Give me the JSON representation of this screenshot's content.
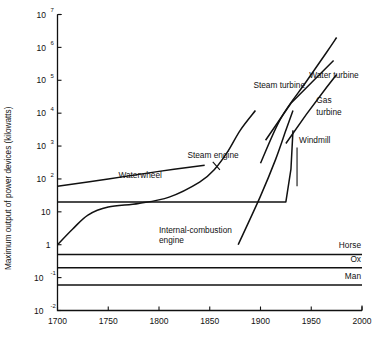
{
  "chart_data": {
    "type": "line",
    "title": "",
    "xlabel": "",
    "ylabel": "Maximum output of power devices (kilowatts)",
    "xlim": [
      1700,
      2000
    ],
    "ylim": [
      0.01,
      10000000
    ],
    "yscale": "log",
    "xscale": "linear",
    "grid": false,
    "legend": "inline-annotations",
    "xticks": [
      "1700",
      "1750",
      "1800",
      "1850",
      "1900",
      "1950",
      "2000"
    ],
    "xtick_values": [
      1700,
      1750,
      1800,
      1850,
      1900,
      1950,
      2000
    ],
    "yticks": [
      {
        "base": "10",
        "exp": "7",
        "value": 10000000
      },
      {
        "base": "10",
        "exp": "6",
        "value": 1000000
      },
      {
        "base": "10",
        "exp": "5",
        "value": 100000
      },
      {
        "base": "10",
        "exp": "4",
        "value": 10000
      },
      {
        "base": "10",
        "exp": "3",
        "value": 1000
      },
      {
        "base": "10",
        "exp": "2",
        "value": 100
      },
      {
        "base": "10",
        "exp": "",
        "value": 10
      },
      {
        "base": "1",
        "exp": "",
        "value": 1
      },
      {
        "base": "10",
        "exp": "-1",
        "value": 0.1
      },
      {
        "base": "10",
        "exp": "-2",
        "value": 0.01
      }
    ],
    "series": [
      {
        "name": "Waterwheel",
        "label": "Waterwheel",
        "points": [
          [
            1700,
            60
          ],
          [
            1750,
            100
          ],
          [
            1800,
            170
          ],
          [
            1845,
            260
          ]
        ]
      },
      {
        "name": "Windmill",
        "label": "Windmill",
        "points": [
          [
            1700,
            20
          ],
          [
            1800,
            20
          ],
          [
            1900,
            20
          ],
          [
            1925,
            20
          ],
          [
            1930,
            200
          ],
          [
            1932,
            3000
          ]
        ]
      },
      {
        "name": "Steam engine",
        "label": "Steam engine",
        "points": [
          [
            1700,
            1
          ],
          [
            1715,
            3
          ],
          [
            1730,
            8
          ],
          [
            1750,
            14
          ],
          [
            1780,
            18
          ],
          [
            1810,
            28
          ],
          [
            1840,
            80
          ],
          [
            1855,
            200
          ],
          [
            1868,
            700
          ],
          [
            1880,
            3000
          ],
          [
            1895,
            12000
          ]
        ]
      },
      {
        "name": "Internal-combustion engine",
        "label": "Internal-combustion engine",
        "points": [
          [
            1878,
            1
          ],
          [
            1900,
            30
          ],
          [
            1915,
            400
          ],
          [
            1925,
            3000
          ],
          [
            1932,
            12000
          ]
        ]
      },
      {
        "name": "Steam turbine",
        "label": "Steam turbine",
        "points": [
          [
            1900,
            300
          ],
          [
            1920,
            7000
          ],
          [
            1945,
            90000
          ],
          [
            1965,
            700000
          ],
          [
            1975,
            2000000
          ]
        ]
      },
      {
        "name": "Water turbine",
        "label": "Water turbine",
        "points": [
          [
            1905,
            1500
          ],
          [
            1930,
            20000
          ],
          [
            1955,
            120000
          ],
          [
            1972,
            400000
          ]
        ]
      },
      {
        "name": "Gas turbine",
        "label": "Gas turbine",
        "points": [
          [
            1925,
            1200
          ],
          [
            1945,
            9000
          ],
          [
            1965,
            60000
          ],
          [
            1975,
            150000
          ]
        ]
      },
      {
        "name": "Horse",
        "label": "Horse",
        "points": [
          [
            1700,
            0.5
          ],
          [
            2000,
            0.5
          ]
        ]
      },
      {
        "name": "Ox",
        "label": "Ox",
        "points": [
          [
            1700,
            0.2
          ],
          [
            2000,
            0.2
          ]
        ]
      },
      {
        "name": "Man",
        "label": "Man",
        "points": [
          [
            1700,
            0.06
          ],
          [
            2000,
            0.06
          ]
        ]
      }
    ],
    "annotations": [
      {
        "text": "Waterwheel",
        "x": 1760,
        "y": 110
      },
      {
        "text": "Steam engine",
        "x": 1828,
        "y": 420
      },
      {
        "text": "Steam turbine",
        "x": 1893,
        "y": 60000
      },
      {
        "text": "Water turbine",
        "x": 1948,
        "y": 120000
      },
      {
        "text": "Gas",
        "x": 1955,
        "y": 20000
      },
      {
        "text": "turbine",
        "x": 1955,
        "y": 9000
      },
      {
        "text": "Windmill",
        "x": 1938,
        "y": 1200
      },
      {
        "text": "Internal-combustion",
        "x": 1800,
        "y": 2.2
      },
      {
        "text": "engine",
        "x": 1800,
        "y": 1.1
      },
      {
        "text": "Horse",
        "x": 1985,
        "y": 0.8
      },
      {
        "text": "Ox",
        "x": 1985,
        "y": 0.3
      },
      {
        "text": "Man",
        "x": 1985,
        "y": 0.09
      }
    ]
  },
  "axis": {
    "y_title": "Maximum output of power devices (kilowatts)"
  }
}
